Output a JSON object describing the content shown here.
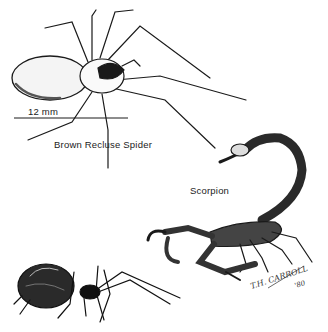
{
  "illustration": {
    "scale_bar_label": "12 mm",
    "spider_label": "Brown Recluse Spider",
    "scorpion_label": "Scorpion",
    "signature": "T.H. CARROLL",
    "signature_year": "'80"
  },
  "colors": {
    "ink": "#1a1a1a",
    "paper": "#ffffff"
  }
}
